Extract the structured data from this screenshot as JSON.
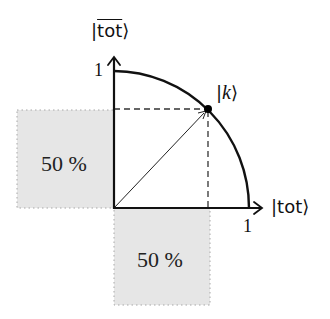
{
  "diagram": {
    "axes": {
      "x_label_prefix": "|",
      "x_label_core": "tot",
      "x_label_suffix": "⟩",
      "y_label_prefix": "|",
      "y_label_core": "tot",
      "y_label_suffix": "⟩",
      "x_tick": "1",
      "y_tick": "1"
    },
    "point": {
      "label_prefix": "|",
      "label_core": "k",
      "label_suffix": "⟩"
    },
    "regions": [
      {
        "id": "left",
        "label": "50 %"
      },
      {
        "id": "bottom",
        "label": "50 %"
      }
    ],
    "colors": {
      "stroke": "#111111",
      "region_fill": "#e6e6e6",
      "region_border": "#a8a8a8",
      "dashed": "#333333"
    }
  }
}
